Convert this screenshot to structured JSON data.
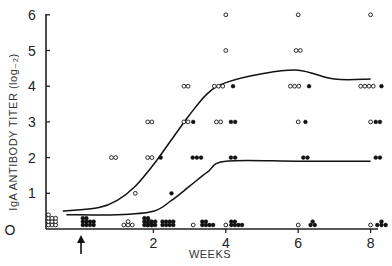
{
  "chart_data": {
    "type": "scatter",
    "title": "",
    "xlabel": "WEEKS",
    "ylabel": "IgA ANTIBODY TITER (log₋₂)",
    "x_ticks": [
      "2",
      "4",
      "6",
      "8"
    ],
    "y_ticks": [
      "O",
      "1",
      "2",
      "3",
      "4",
      "5",
      "6"
    ],
    "xlim": [
      -1,
      8.2
    ],
    "ylim": [
      0,
      6
    ],
    "grid": false,
    "legend": null,
    "annotations": [
      {
        "type": "arrow",
        "x": 0,
        "label": "immunization (arrow, up)"
      }
    ],
    "series": [
      {
        "name": "open circles",
        "marker": "open-circle",
        "points": [
          {
            "x": -0.8,
            "y": 0,
            "n": 10
          },
          {
            "x": 1.3,
            "y": 0,
            "n": 4
          },
          {
            "x": 1.9,
            "y": 0,
            "n": 3
          },
          {
            "x": 3.1,
            "y": 0,
            "n": 1
          },
          {
            "x": 4.0,
            "y": 0,
            "n": 1
          },
          {
            "x": 6.0,
            "y": 0,
            "n": 1
          },
          {
            "x": 8.0,
            "y": 0,
            "n": 1
          },
          {
            "x": 1.5,
            "y": 1,
            "n": 1
          },
          {
            "x": 0.9,
            "y": 2,
            "n": 2
          },
          {
            "x": 1.9,
            "y": 2,
            "n": 2
          },
          {
            "x": 1.9,
            "y": 3,
            "n": 2
          },
          {
            "x": 2.9,
            "y": 3,
            "n": 2
          },
          {
            "x": 3.8,
            "y": 3,
            "n": 2
          },
          {
            "x": 6.0,
            "y": 3,
            "n": 1
          },
          {
            "x": 8.0,
            "y": 3,
            "n": 1
          },
          {
            "x": 2.9,
            "y": 4,
            "n": 2
          },
          {
            "x": 3.8,
            "y": 4,
            "n": 3
          },
          {
            "x": 5.9,
            "y": 4,
            "n": 3
          },
          {
            "x": 7.9,
            "y": 4,
            "n": 4
          },
          {
            "x": 4.0,
            "y": 5,
            "n": 1
          },
          {
            "x": 6.0,
            "y": 5,
            "n": 2
          },
          {
            "x": 4.0,
            "y": 6,
            "n": 1
          },
          {
            "x": 6.0,
            "y": 6,
            "n": 1
          },
          {
            "x": 8.0,
            "y": 6,
            "n": 1
          }
        ]
      },
      {
        "name": "filled circles",
        "marker": "filled-circle",
        "points": [
          {
            "x": 0.2,
            "y": 0,
            "n": 10
          },
          {
            "x": 1.9,
            "y": 0,
            "n": 10
          },
          {
            "x": 2.4,
            "y": 0,
            "n": 8
          },
          {
            "x": 3.5,
            "y": 0,
            "n": 6
          },
          {
            "x": 4.3,
            "y": 0,
            "n": 6
          },
          {
            "x": 6.4,
            "y": 0,
            "n": 3
          },
          {
            "x": 8.3,
            "y": 0,
            "n": 4
          },
          {
            "x": 2.5,
            "y": 1,
            "n": 1
          },
          {
            "x": 2.2,
            "y": 2,
            "n": 1
          },
          {
            "x": 3.2,
            "y": 2,
            "n": 3
          },
          {
            "x": 4.2,
            "y": 2,
            "n": 2
          },
          {
            "x": 6.2,
            "y": 2,
            "n": 2
          },
          {
            "x": 8.2,
            "y": 2,
            "n": 2
          },
          {
            "x": 3.1,
            "y": 3,
            "n": 1
          },
          {
            "x": 4.2,
            "y": 3,
            "n": 2
          },
          {
            "x": 6.2,
            "y": 3,
            "n": 1
          },
          {
            "x": 8.2,
            "y": 3,
            "n": 2
          },
          {
            "x": 4.2,
            "y": 4,
            "n": 1
          },
          {
            "x": 6.3,
            "y": 4,
            "n": 1
          },
          {
            "x": 8.3,
            "y": 4,
            "n": 1
          }
        ]
      }
    ],
    "curves": [
      {
        "name": "upper fitted curve (open circles)",
        "x": [
          -0.5,
          0.5,
          1.0,
          1.5,
          2.0,
          2.5,
          3.0,
          3.5,
          4.0,
          5.0,
          6.0,
          7.0,
          8.0
        ],
        "y": [
          0.5,
          0.6,
          0.8,
          1.2,
          1.8,
          2.5,
          3.2,
          3.8,
          4.1,
          4.35,
          4.45,
          4.2,
          4.2
        ]
      },
      {
        "name": "lower fitted curve (filled circles)",
        "x": [
          -0.4,
          1.0,
          2.0,
          2.5,
          3.0,
          3.5,
          4.0,
          6.0,
          8.0
        ],
        "y": [
          0.4,
          0.4,
          0.5,
          0.8,
          1.2,
          1.6,
          1.9,
          1.9,
          1.9
        ]
      }
    ]
  }
}
